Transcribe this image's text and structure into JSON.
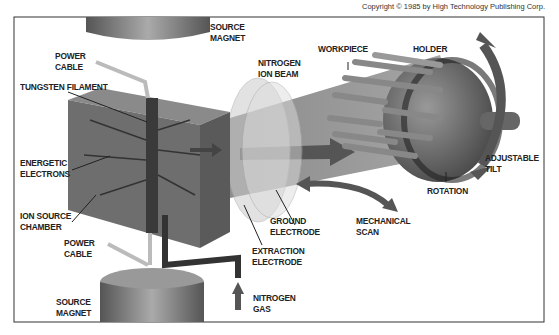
{
  "copyright": "Copyright © 1985 by High Technology Publishing Corp.",
  "labels": {
    "source_magnet_top": "SOURCE\nMAGNET",
    "power_cable_top": "POWER\nCABLE",
    "tungsten_filament": "TUNGSTEN FILAMENT",
    "nitrogen_ion_beam": "NITROGEN\nION BEAM",
    "workpiece": "WORKPIECE",
    "holder": "HOLDER",
    "energetic_electrons": "ENERGETIC\nELECTRONS",
    "adjustable_tilt": "ADJUSTABLE\nTILT",
    "rotation": "ROTATION",
    "ion_source_chamber": "ION SOURCE\nCHAMBER",
    "ground_electrode": "GROUND\nELECTRODE",
    "mechanical_scan": "MECHANICAL\nSCAN",
    "power_cable_bottom": "POWER\nCABLE",
    "extraction_electrode": "EXTRACTION\nELECTRODE",
    "source_magnet_bottom": "SOURCE\nMAGNET",
    "nitrogen_gas": "NITROGEN\nGAS"
  },
  "colors": {
    "frame": "#333333",
    "label_text": "#222222",
    "chamber": "#6e6e6e",
    "beam": "#8a8a8a",
    "magnet": "#7a7a7a"
  }
}
